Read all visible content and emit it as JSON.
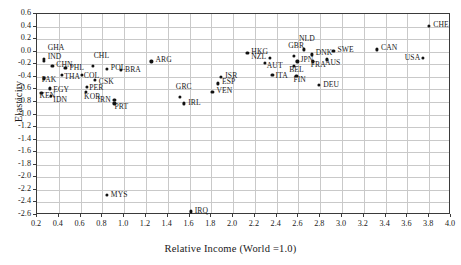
{
  "chart_data": {
    "type": "scatter",
    "title": "",
    "xlabel": "Relative Income (World =1.0)",
    "ylabel": "Elasticity",
    "xlim": [
      0.2,
      4.0
    ],
    "ylim": [
      -2.6,
      0.6
    ],
    "xticks": [
      "0.2",
      "0.4",
      "0.6",
      "0.8",
      "1.0",
      "1.2",
      "1.4",
      "1.6",
      "1.8",
      "2.0",
      "2.2",
      "2.4",
      "2.6",
      "2.8",
      "3.0",
      "3.2",
      "3.4",
      "3.6",
      "3.8",
      "4.0"
    ],
    "yticks": [
      "0.6",
      "0.4",
      "0.2",
      "0.0",
      "-0.2",
      "-0.4",
      "-0.6",
      "-0.8",
      "-1.0",
      "-1.2",
      "-1.4",
      "-1.6",
      "-1.8",
      "-2.0",
      "-2.2",
      "-2.4",
      "-2.6"
    ],
    "grid": true,
    "legend": "none",
    "marker_color": "#111111",
    "points": [
      {
        "label": "GHA",
        "x": 0.27,
        "y": -0.13,
        "lx": 4,
        "ly": -11
      },
      {
        "label": "IND",
        "x": 0.27,
        "y": -0.16,
        "lx": 4,
        "ly": -4
      },
      {
        "label": "CHN",
        "x": 0.35,
        "y": -0.24,
        "lx": 4,
        "ly": -1
      },
      {
        "label": "PHL",
        "x": 0.47,
        "y": -0.27,
        "lx": 4,
        "ly": 0
      },
      {
        "label": "PAK",
        "x": 0.27,
        "y": -0.44,
        "lx": -2,
        "ly": 2
      },
      {
        "label": "THA",
        "x": 0.44,
        "y": -0.39,
        "lx": 2,
        "ly": 2
      },
      {
        "label": "COL",
        "x": 0.62,
        "y": -0.39,
        "lx": 2,
        "ly": 1
      },
      {
        "label": "CHL",
        "x": 0.72,
        "y": -0.24,
        "lx": 1,
        "ly": -10
      },
      {
        "label": "POL",
        "x": 0.85,
        "y": -0.29,
        "lx": 4,
        "ly": -1
      },
      {
        "label": "BRA",
        "x": 0.98,
        "y": -0.3,
        "lx": 4,
        "ly": 0
      },
      {
        "label": "ARG",
        "x": 1.26,
        "y": -0.17,
        "lx": 4,
        "ly": -1
      },
      {
        "label": "CSK",
        "x": 0.74,
        "y": -0.46,
        "lx": 4,
        "ly": 2
      },
      {
        "label": "PER",
        "x": 0.67,
        "y": -0.58,
        "lx": 2,
        "ly": 1
      },
      {
        "label": "EGY",
        "x": 0.33,
        "y": -0.6,
        "lx": 3,
        "ly": 2
      },
      {
        "label": "KEN",
        "x": 0.25,
        "y": -0.67,
        "lx": -2,
        "ly": 3
      },
      {
        "label": "IDN",
        "x": 0.34,
        "y": -0.72,
        "lx": 2,
        "ly": 4
      },
      {
        "label": "KOR",
        "x": 0.66,
        "y": -0.66,
        "lx": -2,
        "ly": 5
      },
      {
        "label": "IRN",
        "x": 0.92,
        "y": -0.79,
        "lx": -17,
        "ly": 0
      },
      {
        "label": "PRT",
        "x": 0.92,
        "y": -0.84,
        "lx": 0,
        "ly": 4
      },
      {
        "label": "GRC",
        "x": 1.52,
        "y": -0.74,
        "lx": -4,
        "ly": -10
      },
      {
        "label": "IRL",
        "x": 1.56,
        "y": -0.84,
        "lx": 4,
        "ly": 0
      },
      {
        "label": "VEN",
        "x": 1.82,
        "y": -0.65,
        "lx": 4,
        "ly": -1
      },
      {
        "label": "ISR",
        "x": 1.9,
        "y": -0.42,
        "lx": 4,
        "ly": -1
      },
      {
        "label": "ESP",
        "x": 1.87,
        "y": -0.52,
        "lx": 4,
        "ly": -1
      },
      {
        "label": "MYS",
        "x": 0.85,
        "y": -2.3,
        "lx": 4,
        "ly": 0
      },
      {
        "label": "IRQ",
        "x": 1.62,
        "y": -2.56,
        "lx": 4,
        "ly": 0
      },
      {
        "label": "HKG",
        "x": 2.14,
        "y": -0.03,
        "lx": 4,
        "ly": -1
      },
      {
        "label": "NZL",
        "x": 2.35,
        "y": -0.12,
        "lx": -19,
        "ly": -1
      },
      {
        "label": "AUT",
        "x": 2.3,
        "y": -0.2,
        "lx": 2,
        "ly": 3
      },
      {
        "label": "ITA",
        "x": 2.37,
        "y": -0.38,
        "lx": 3,
        "ly": 1
      },
      {
        "label": "GBR",
        "x": 2.57,
        "y": -0.08,
        "lx": -6,
        "ly": -10
      },
      {
        "label": "NLD",
        "x": 2.66,
        "y": 0.02,
        "lx": -5,
        "ly": -10
      },
      {
        "label": "BEL",
        "x": 2.57,
        "y": -0.24,
        "lx": -5,
        "ly": 4
      },
      {
        "label": "JPN",
        "x": 2.6,
        "y": -0.17,
        "lx": 3,
        "ly": -1
      },
      {
        "label": "FIN",
        "x": 2.59,
        "y": -0.4,
        "lx": -3,
        "ly": 4
      },
      {
        "label": "DNK",
        "x": 2.73,
        "y": -0.06,
        "lx": 4,
        "ly": -1
      },
      {
        "label": "FRA",
        "x": 2.74,
        "y": -0.17,
        "lx": -2,
        "ly": 4
      },
      {
        "label": "AUS",
        "x": 2.87,
        "y": -0.14,
        "lx": -2,
        "ly": 4
      },
      {
        "label": "SWE",
        "x": 2.93,
        "y": 0.0,
        "lx": 4,
        "ly": -1
      },
      {
        "label": "DEU",
        "x": 2.8,
        "y": -0.55,
        "lx": 4,
        "ly": 0
      },
      {
        "label": "CAN",
        "x": 3.33,
        "y": 0.02,
        "lx": 4,
        "ly": -1
      },
      {
        "label": "USA",
        "x": 3.75,
        "y": -0.11,
        "lx": -18,
        "ly": 0
      },
      {
        "label": "CHE",
        "x": 3.81,
        "y": 0.4,
        "lx": 4,
        "ly": -1
      }
    ]
  }
}
